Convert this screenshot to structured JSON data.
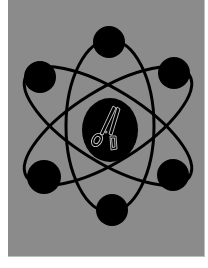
{
  "artwork": {
    "description": "atom-style illustration with scissors in nucleus",
    "colors": {
      "page_background": "#ffffff",
      "panel_background": "#8b8b8b",
      "shapes": "#000000",
      "scissors_outline": "#cfcfcf"
    },
    "electrons": [
      {
        "id": "top",
        "cx": 109,
        "cy": 42,
        "r": 16
      },
      {
        "id": "top-right",
        "cx": 174,
        "cy": 73,
        "r": 16
      },
      {
        "id": "top-left",
        "cx": 40,
        "cy": 77,
        "r": 16
      },
      {
        "id": "bottom-left",
        "cx": 44,
        "cy": 177,
        "r": 17
      },
      {
        "id": "bottom-right",
        "cx": 173,
        "cy": 175,
        "r": 16
      },
      {
        "id": "bottom",
        "cx": 112,
        "cy": 210,
        "r": 16
      }
    ],
    "nucleus": {
      "cx": 110,
      "cy": 130,
      "rx": 28,
      "ry": 32,
      "icon": "scissors-icon"
    }
  }
}
